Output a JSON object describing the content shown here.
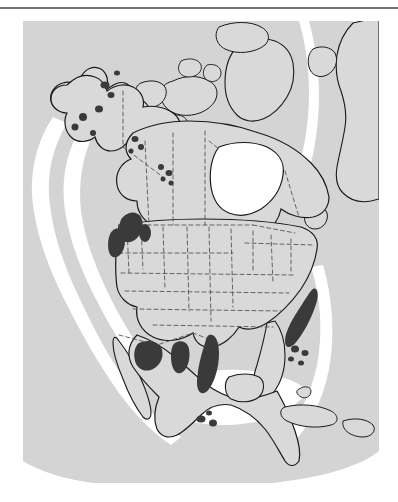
{
  "figure": {
    "type": "distribution-map",
    "region": "North America",
    "caption": "",
    "has_top_rule": true
  },
  "colors": {
    "page_background": "#ffffff",
    "rule": "#6b6e72",
    "ocean": "#d4d4d4",
    "shelf_band": "#ffffff",
    "land": "#d9d9d9",
    "coastline": "#1a1a1a",
    "political_boundary": "#555555",
    "range_polygon": "#3a3a3a"
  },
  "map": {
    "frame": {
      "x": 23,
      "y": 21,
      "width": 356,
      "height": 462
    },
    "layers": [
      {
        "name": "ocean-background",
        "fill": "#d4d4d4",
        "interactable": false
      },
      {
        "name": "continental-shelf-band",
        "fill": "#ffffff",
        "interactable": false
      },
      {
        "name": "landmass",
        "fill": "#d9d9d9",
        "stroke": "#1a1a1a",
        "interactable": false
      },
      {
        "name": "political-boundaries",
        "style": "dashed",
        "stroke": "#555555",
        "interactable": false
      },
      {
        "name": "distribution-range",
        "fill": "#3a3a3a",
        "interactable": false
      }
    ],
    "landmasses": [
      "Alaska",
      "Canada",
      "Greenland",
      "Canadian Arctic Archipelago",
      "Hudson Bay",
      "Contiguous United States",
      "Mexico",
      "Central America",
      "Baja California",
      "Cuba",
      "Caribbean Islands",
      "Great Lakes"
    ],
    "range_markers": {
      "legend_label": "",
      "total_clusters": 7,
      "clusters": [
        {
          "name": "alaska-british-columbia-dots",
          "count": 14,
          "shape": "dots"
        },
        {
          "name": "pacific-northwest-blobs",
          "count": 3,
          "shape": "blobs"
        },
        {
          "name": "great-basin-patch",
          "count": 1,
          "shape": "polygon"
        },
        {
          "name": "colorado-plateau-patch",
          "count": 1,
          "shape": "polygon"
        },
        {
          "name": "southern-rockies-strip",
          "count": 1,
          "shape": "elongated-polygon"
        },
        {
          "name": "appalachian-strip",
          "count": 5,
          "shape": "elongated-polygon-and-dots"
        },
        {
          "name": "sierra-madre-oriental-dots",
          "count": 3,
          "shape": "dots"
        }
      ]
    }
  }
}
